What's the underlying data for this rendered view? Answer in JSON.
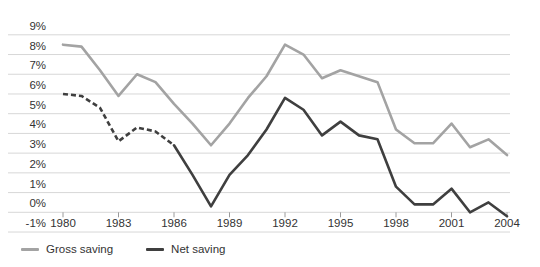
{
  "chart_data": {
    "type": "line",
    "title": "",
    "xlabel": "",
    "ylabel": "",
    "x": [
      1980,
      1981,
      1982,
      1983,
      1984,
      1985,
      1986,
      1987,
      1988,
      1989,
      1990,
      1991,
      1992,
      1993,
      1994,
      1995,
      1996,
      1997,
      1998,
      1999,
      2000,
      2001,
      2002,
      2003,
      2004
    ],
    "series": [
      {
        "name": "Gross saving",
        "color": "#a3a3a3",
        "style": "solid",
        "values": [
          8.5,
          8.4,
          7.2,
          5.9,
          7.0,
          6.6,
          5.5,
          4.5,
          3.4,
          4.5,
          5.8,
          6.9,
          8.5,
          8.0,
          6.8,
          7.2,
          6.9,
          6.6,
          4.2,
          3.5,
          3.5,
          4.5,
          3.3,
          3.7,
          2.9
        ]
      },
      {
        "name": "Net saving",
        "color": "#3f3f3f",
        "style": "dashed-then-solid",
        "dashed_x_range": [
          1980,
          1986
        ],
        "values": [
          6.0,
          5.9,
          5.3,
          3.6,
          4.3,
          4.1,
          3.4,
          1.9,
          0.3,
          1.9,
          2.9,
          4.2,
          5.8,
          5.2,
          3.9,
          4.6,
          3.9,
          3.7,
          1.3,
          0.4,
          0.4,
          1.2,
          0.0,
          0.5,
          -0.2
        ]
      }
    ],
    "ylim": [
      -1,
      9
    ],
    "ytick_labels": [
      "9%",
      "8%",
      "7%",
      "6%",
      "5%",
      "4%",
      "3%",
      "2%",
      "1%",
      "0%",
      "-1%"
    ],
    "xtick_labels": [
      "1980",
      "1983",
      "1986",
      "1989",
      "1992",
      "1995",
      "1998",
      "2001",
      "2004"
    ],
    "grid": "horizontal",
    "legend_position": "bottom-left"
  },
  "legend": {
    "items": [
      {
        "label": "Gross saving"
      },
      {
        "label": "Net saving"
      }
    ]
  },
  "colors": {
    "gross_line": "#a3a3a3",
    "net_line": "#3f3f3f",
    "gridline": "#d7d7d7",
    "tick": "#9a9a9a",
    "label_text": "#333333",
    "background": "#ffffff"
  }
}
